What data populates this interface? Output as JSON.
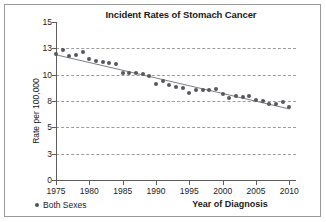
{
  "chart_data": {
    "type": "scatter",
    "title": "Incident Rates of Stomach Cancer",
    "xlabel": "Year of Diagnosis",
    "ylabel": "Rate per 100,000",
    "grid": true,
    "legend_position": "bottom-left",
    "xlim": [
      1975,
      2011
    ],
    "ylim": [
      0,
      15
    ],
    "xticks": [
      1975,
      1980,
      1985,
      1990,
      1995,
      2000,
      2005,
      2010
    ],
    "xtick_labels": [
      "1975",
      "1980",
      "1985",
      "1990",
      "1995",
      "2000",
      "2005",
      "2010"
    ],
    "yticks": [
      0,
      3,
      5,
      8,
      10,
      13,
      15
    ],
    "ytick_labels": [
      "0",
      "3",
      "5",
      "8",
      "10",
      "13",
      "15"
    ],
    "gridline_values": [
      3,
      5,
      8,
      10,
      13
    ],
    "series": [
      {
        "name": "Both Sexes",
        "marker": "circle",
        "color": "#55585c",
        "trendline": true,
        "x": [
          1975,
          1976,
          1977,
          1978,
          1979,
          1980,
          1981,
          1982,
          1983,
          1984,
          1985,
          1986,
          1987,
          1988,
          1989,
          1990,
          1991,
          1992,
          1993,
          1994,
          1995,
          1996,
          1997,
          1998,
          1999,
          2000,
          2001,
          2002,
          2003,
          2004,
          2005,
          2006,
          2007,
          2008,
          2009,
          2010
        ],
        "values": [
          12.3,
          12.8,
          12.1,
          12.2,
          12.6,
          11.8,
          11.6,
          11.4,
          11.3,
          11.2,
          10.2,
          10.2,
          10.2,
          10.1,
          9.9,
          9.3,
          9.5,
          9.2,
          9.1,
          9.0,
          8.6,
          8.8,
          8.8,
          8.8,
          8.9,
          8.5,
          8.2,
          8.4,
          8.3,
          8.4,
          8.1,
          8.0,
          7.7,
          7.7,
          7.9,
          7.3
        ]
      }
    ]
  },
  "legend": {
    "marker_name": "series-marker-dot",
    "label": "Both Sexes"
  }
}
